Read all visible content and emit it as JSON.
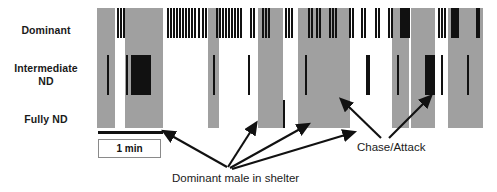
{
  "figure": {
    "type": "ethogram-raster",
    "rows": [
      {
        "id": "dominant",
        "label": "Dominant"
      },
      {
        "id": "intermediate",
        "label": "Intermediate\nND"
      },
      {
        "id": "fully",
        "label": "Fully ND"
      }
    ],
    "scale": {
      "label": "1 min",
      "bar_left_px": 98,
      "bar_width_px": 65
    },
    "annotations": [
      {
        "id": "shelter",
        "label": "Dominant male in shelter"
      },
      {
        "id": "chase",
        "label": "Chase/Attack"
      }
    ],
    "colors": {
      "shelter_block": "#a0a0a0",
      "tick": "#111111",
      "background": "#ffffff",
      "text": "#1a1a1a"
    },
    "shelter_blocks": [
      {
        "x": 2,
        "w": 18
      },
      {
        "x": 30,
        "w": 38
      },
      {
        "x": 113,
        "w": 11
      },
      {
        "x": 163,
        "w": 25
      },
      {
        "x": 203,
        "w": 52
      },
      {
        "x": 297,
        "w": 17
      },
      {
        "x": 316,
        "w": 24
      },
      {
        "x": 353,
        "w": 35
      }
    ],
    "ticks": {
      "dominant": [
        21.5,
        24.5,
        27.5,
        72,
        75,
        78,
        81,
        84,
        87,
        90,
        93,
        96,
        99,
        103,
        107,
        110,
        121,
        124,
        127,
        130,
        133,
        136,
        139,
        142,
        145,
        155,
        158,
        167,
        170,
        173,
        190,
        193,
        196,
        213,
        216,
        221,
        224,
        234,
        237,
        240,
        254,
        257,
        266,
        269,
        280,
        283,
        293,
        296,
        305,
        307,
        309,
        311,
        313,
        343,
        346,
        349,
        356,
        358,
        360,
        362,
        381,
        383
      ],
      "intermediate": [
        12,
        31,
        36,
        38,
        40,
        42,
        44,
        46,
        48,
        50,
        52,
        54,
        118,
        153,
        210,
        271,
        273,
        302,
        330,
        332,
        334,
        336,
        338,
        346,
        372
      ],
      "fully": [
        188
      ]
    }
  }
}
